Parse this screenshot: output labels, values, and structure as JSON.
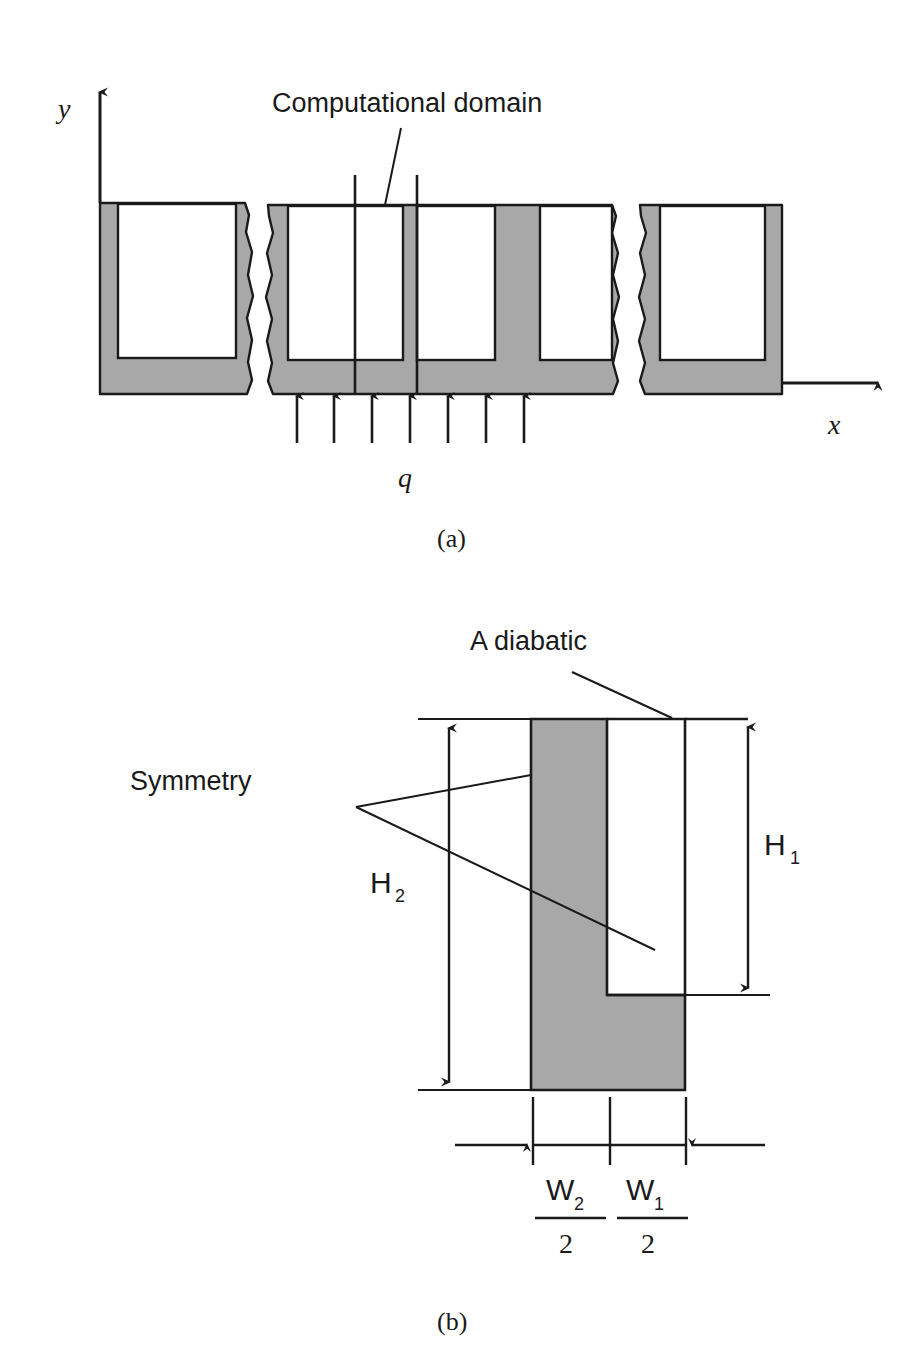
{
  "figure": {
    "kind": "technical-schematic",
    "background_color": "#ffffff",
    "solid_fill_color": "#a8a8a8",
    "line_color": "#1a1a1a",
    "panels": [
      {
        "id": "a",
        "caption": "(a)",
        "description": "Array of microchannels with periodic break symbols, coordinate axes and uniform heat flux applied at the base.",
        "labels": {
          "computational_domain": "Computational domain",
          "axis_y": "y",
          "axis_x": "x",
          "heat_flux": "q"
        },
        "heat_flux_arrow_count": 7,
        "channel_count_visible": 5
      },
      {
        "id": "b",
        "caption": "(b)",
        "description": "Computational domain unit cell: half fin and half channel with adiabatic top, symmetry side walls and labelled dimensions.",
        "labels": {
          "adiabatic": "A diabatic",
          "symmetry": "Symmetry",
          "height_outer": "H",
          "height_outer_sub": "2",
          "height_inner": "H",
          "height_inner_sub": "1",
          "width_fin": "W",
          "width_fin_sub": "2",
          "width_fin_denominator": "2",
          "width_channel": "W",
          "width_channel_sub": "1",
          "width_channel_denominator": "2"
        }
      }
    ]
  }
}
